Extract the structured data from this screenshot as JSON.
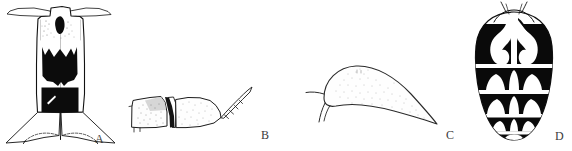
{
  "plate": {
    "width": 572,
    "height": 151,
    "background_color": "#ffffff",
    "ink_color": "#000000",
    "label_color": "#3b3b3b",
    "description": "Scientific line-drawing plate with four labelled figures"
  },
  "figures": [
    {
      "id": "A",
      "label": "A",
      "name": "figure-a-ventral-abdomen",
      "description": "Elongate ventral view with flared anterior margin, two large black median blotches and a small dark anterior spot; posterior pair of triangular lobes"
    },
    {
      "id": "B",
      "label": "B",
      "name": "figure-b-lateral-appendage",
      "description": "Lateral view of two stippled basal segments followed by a tapering curved segmented process"
    },
    {
      "id": "C",
      "label": "C",
      "name": "figure-c-teardrop-structure",
      "description": "Broad rounded structure tapering to a fine point, finely stippled, with two small basal projections at left"
    },
    {
      "id": "D",
      "label": "D",
      "name": "figure-d-dorsal-abdomen",
      "description": "Oval dorsal view with five transverse bands of bold black markings separated by pale lines, small paired anterior projections"
    }
  ],
  "labels": {
    "a": "A",
    "b": "B",
    "c": "C",
    "d": "D"
  }
}
